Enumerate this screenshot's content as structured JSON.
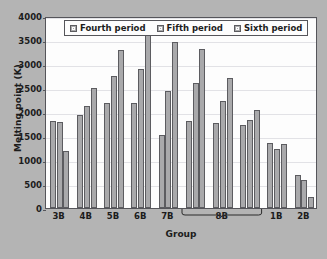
{
  "chart_data": {
    "type": "bar",
    "title": "",
    "xlabel": "Group",
    "ylabel": "Melting point (K)",
    "ylim": [
      0,
      4000
    ],
    "ytick_values": [
      0,
      500,
      1000,
      1500,
      2000,
      2500,
      3000,
      3500,
      4000
    ],
    "ytick_labels": [
      "0",
      "500",
      "1000",
      "1500",
      "2000",
      "2500",
      "3000",
      "3500",
      "4000"
    ],
    "grid": true,
    "legend_position": "top-center",
    "categories": [
      "3B",
      "4B",
      "5B",
      "6B",
      "7B",
      "8B",
      "8B",
      "8B",
      "1B",
      "2B"
    ],
    "group_labels": [
      "3B",
      "4B",
      "5B",
      "6B",
      "7B",
      "8B",
      "1B",
      "2B"
    ],
    "bracket_label": "8B",
    "bracket_spans_clusters": 3,
    "series": [
      {
        "name": "Fourth period",
        "color": "#a9a9ab",
        "values": [
          1814,
          1941,
          2183,
          2180,
          1519,
          1811,
          1768,
          1728,
          1358,
          693
        ]
      },
      {
        "name": "Fifth period",
        "color": "#a9a9ab",
        "values": [
          1799,
          2128,
          2750,
          2896,
          2430,
          2607,
          2237,
          1828,
          1235,
          594
        ]
      },
      {
        "name": "Sixth period",
        "color": "#a9a9ab",
        "values": [
          1193,
          2506,
          3290,
          3695,
          3459,
          3306,
          2719,
          2041,
          1337,
          234
        ]
      }
    ]
  },
  "legend": {
    "items": [
      {
        "label": "Fourth period"
      },
      {
        "label": "Fifth period"
      },
      {
        "label": "Sixth period"
      }
    ]
  }
}
